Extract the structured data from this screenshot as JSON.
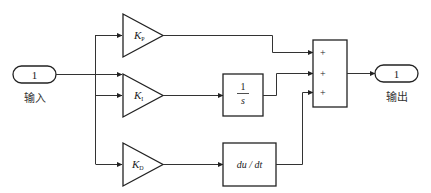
{
  "diagram": {
    "input_port": {
      "number": "1",
      "label": "输入"
    },
    "output_port": {
      "number": "1",
      "label": "输出"
    },
    "gains": [
      {
        "symbol": "K",
        "subscript": "P"
      },
      {
        "symbol": "K",
        "subscript": "I"
      },
      {
        "symbol": "K",
        "subscript": "D"
      }
    ],
    "integrator": {
      "numerator": "1",
      "denominator": "s"
    },
    "derivative": {
      "label": "du / dt"
    },
    "sum": {
      "signs": [
        "+",
        "+",
        "+"
      ]
    },
    "colors": {
      "line": "#333333",
      "block_border": "#222222",
      "background": "#ffffff"
    }
  }
}
